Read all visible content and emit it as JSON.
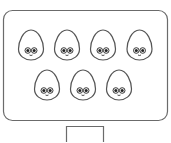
{
  "scene": {
    "container": "rounded-rectangle",
    "character": "egg-with-eyes",
    "rows": [
      {
        "count": 4
      },
      {
        "count": 3
      }
    ],
    "total_characters": 7,
    "below_container": "open-box",
    "stroke_color": "#555555",
    "container_stroke_color": "#6b6b6b",
    "fill_color": "#ffffff",
    "eye_color": "#222222"
  }
}
